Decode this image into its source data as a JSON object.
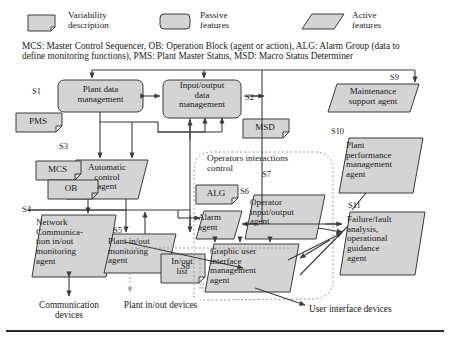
{
  "legend": {
    "items": [
      {
        "key": "variability",
        "label_line1": "Variability",
        "label_line2": "description",
        "shape": "note-rect-folded-corner"
      },
      {
        "key": "passive",
        "label_line1": "Passive",
        "label_line2": "features",
        "shape": "rounded-rect"
      },
      {
        "key": "active",
        "label_line1": "Active",
        "label_line2": "features",
        "shape": "parallelogram"
      }
    ]
  },
  "caption": {
    "line1": "MCS: Master Control Sequencer, OB: Operation Block (agent or action), ALG: Alarm Group (data to",
    "line2": "define monitoring functions), PMS: Plant Master Status, MSD: Macro Status Determiner"
  },
  "group": {
    "label_line1": "Operators interactions",
    "label_line2": "control"
  },
  "nodes": [
    {
      "id": "S1",
      "tag": "S1",
      "shape": "rounded-rect",
      "lines": [
        "Plant data",
        "management"
      ]
    },
    {
      "id": "S2",
      "tag": "S2",
      "shape": "rounded-rect",
      "lines": [
        "Input/output",
        "data",
        "management"
      ]
    },
    {
      "id": "S3",
      "tag": "S3",
      "shape": "parallelogram",
      "lines": [
        "Automatic",
        "control",
        "agent"
      ]
    },
    {
      "id": "S4",
      "tag": "S4",
      "shape": "parallelogram",
      "lines": [
        "Network",
        "Communica-",
        "tion in/out",
        "monitoring",
        "agent"
      ]
    },
    {
      "id": "S5",
      "tag": "S5",
      "shape": "parallelogram",
      "lines": [
        "Plant in/out",
        "monitoring",
        "agent"
      ]
    },
    {
      "id": "S6",
      "tag": "S6",
      "shape": "parallelogram",
      "lines": [
        "Alarm",
        "agent"
      ]
    },
    {
      "id": "S7",
      "tag": "S7",
      "shape": "parallelogram",
      "lines": [
        "Operator",
        "input/output",
        "agent"
      ]
    },
    {
      "id": "S8",
      "tag": "S8",
      "shape": "parallelogram",
      "lines": [
        "Graphic user",
        "interface",
        "management",
        "agent"
      ]
    },
    {
      "id": "S9",
      "tag": "S9",
      "shape": "parallelogram",
      "lines": [
        "Maintenance",
        "support agent"
      ]
    },
    {
      "id": "S10",
      "tag": "S10",
      "shape": "parallelogram",
      "lines": [
        "Plant",
        "performance",
        "management",
        "agent"
      ]
    },
    {
      "id": "S11",
      "tag": "S11",
      "shape": "parallelogram",
      "lines": [
        "Failure/fault",
        "analysis,",
        "operational",
        "guidance",
        "agent"
      ]
    }
  ],
  "variability": [
    {
      "id": "PMS",
      "label": "PMS"
    },
    {
      "id": "MCS",
      "label": "MCS"
    },
    {
      "id": "OB",
      "label": "OB"
    },
    {
      "id": "MSD",
      "label": "MSD"
    },
    {
      "id": "ALG",
      "label": "ALG"
    },
    {
      "id": "INOUT",
      "label_line1": "In/out",
      "label_line2": "list"
    }
  ],
  "devices": [
    {
      "id": "communication",
      "line1": "Communication",
      "line2": "devices"
    },
    {
      "id": "plant-inout",
      "line1": "Plant in/out devices",
      "line2": ""
    },
    {
      "id": "user-interface",
      "line1": "User interface devices",
      "line2": ""
    }
  ],
  "colors": {
    "fill": "#d4d4d4",
    "stroke": "#3a3a3a",
    "text": "#1a1a1a",
    "dashed": "#9a9a9a",
    "rule": "#2b2b2b"
  }
}
